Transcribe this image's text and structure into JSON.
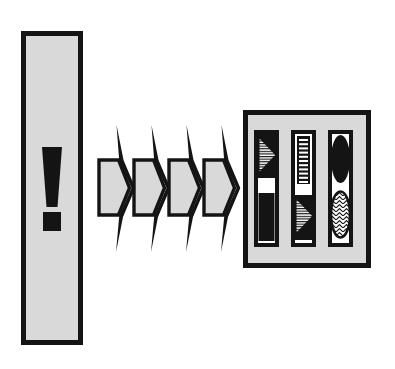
{
  "figure": {
    "title": "Signal propagation diagram",
    "type": "schematic-diagram",
    "background_color": "#ffffff",
    "width": 395,
    "height": 369
  },
  "palette": {
    "ink": "#141414",
    "panel_fill": "#d9d9d9",
    "cell_fill": "#ffffff",
    "background": "#ffffff"
  },
  "source_panel": {
    "name": "source-panel",
    "shape": "tall-vertical-rectangle",
    "x": 21,
    "y": 31,
    "width": 62,
    "height": 314,
    "fill": "#d9d9d9",
    "stroke": "#141414",
    "stroke_width": 5,
    "glyph": {
      "name": "exclamation-mark",
      "character": "!",
      "fill": "#141414",
      "stem": {
        "top_width": 20,
        "bottom_width": 11,
        "top_y": 147,
        "bottom_y": 207
      },
      "dot": {
        "x": 43,
        "y": 212,
        "width": 18,
        "height": 19
      }
    }
  },
  "propagation_arrows": {
    "name": "propagation-arrows",
    "count": 4,
    "direction": "right",
    "body_fill": "#d9d9d9",
    "stroke": "#141414",
    "items": [
      {
        "label": "arrow-1",
        "x": 98,
        "y": 160,
        "width": 30,
        "height": 56
      },
      {
        "label": "arrow-2",
        "x": 133,
        "y": 160,
        "width": 30,
        "height": 56
      },
      {
        "label": "arrow-3",
        "x": 168,
        "y": 160,
        "width": 30,
        "height": 56
      },
      {
        "label": "arrow-4",
        "x": 203,
        "y": 160,
        "width": 30,
        "height": 56
      }
    ],
    "spike": {
      "description": "thin tapering black spike above and below each arrow tip",
      "top_y": 125,
      "bottom_y": 252
    }
  },
  "target_panel": {
    "name": "target-panel",
    "shape": "rectangle",
    "x": 243,
    "y": 110,
    "width": 128,
    "height": 158,
    "fill": "#d9d9d9",
    "stroke": "#141414",
    "stroke_width": 5,
    "columns": [
      {
        "name": "column-1",
        "x": 254,
        "y": 130,
        "width": 25,
        "height": 117,
        "fill": "#ffffff",
        "stroke": "#141414",
        "cells": [
          {
            "name": "hatched-right-triangle-top",
            "glyph": "triangle-right-hatched",
            "position": "top",
            "fill": "#141414",
            "inner_fill": "#ffffff",
            "hatch": "horizontal-lines"
          },
          {
            "name": "solid-black-rectangle",
            "glyph": "rectangle-solid",
            "position": "bottom",
            "fill": "#141414"
          }
        ]
      },
      {
        "name": "column-2",
        "x": 291,
        "y": 130,
        "width": 25,
        "height": 117,
        "fill": "#ffffff",
        "stroke": "#141414",
        "cells": [
          {
            "name": "striped-vertical-bar",
            "glyph": "bar-striped",
            "position": "top",
            "fill": "#141414",
            "stripe_fill": "#ffffff",
            "stripe_count": 11
          },
          {
            "name": "hatched-right-triangle-bottom",
            "glyph": "triangle-right-hatched",
            "position": "bottom",
            "fill": "#141414",
            "inner_fill": "#ffffff",
            "hatch": "horizontal-lines"
          }
        ]
      },
      {
        "name": "column-3",
        "x": 328,
        "y": 130,
        "width": 25,
        "height": 117,
        "fill": "#ffffff",
        "stroke": "#141414",
        "cells": [
          {
            "name": "solid-black-ellipse",
            "glyph": "ellipse-solid",
            "position": "top",
            "fill": "#141414"
          },
          {
            "name": "hatched-white-ellipse",
            "glyph": "ellipse-hatched",
            "position": "bottom",
            "fill": "#ffffff",
            "stroke": "#141414",
            "hatch": "chevron-zigzag"
          }
        ]
      }
    ]
  }
}
